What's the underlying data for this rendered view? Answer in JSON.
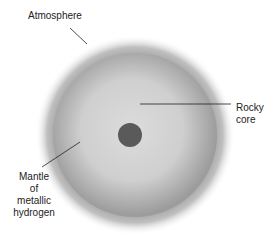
{
  "diagram": {
    "labels": {
      "atmosphere": "Atmosphere",
      "rocky_core_line1": "Rocky",
      "rocky_core_line2": "core",
      "mantle_line1": "Mantle",
      "mantle_line2": "of",
      "mantle_line3": "metallic",
      "mantle_line4": "hydrogen"
    },
    "colors": {
      "core": "#5a5a5a",
      "mantle_inner": "#d4d4d4",
      "mantle_outer": "#9a9a9a",
      "atmosphere": "#b8b8b8",
      "leader_line": "#222222"
    }
  }
}
